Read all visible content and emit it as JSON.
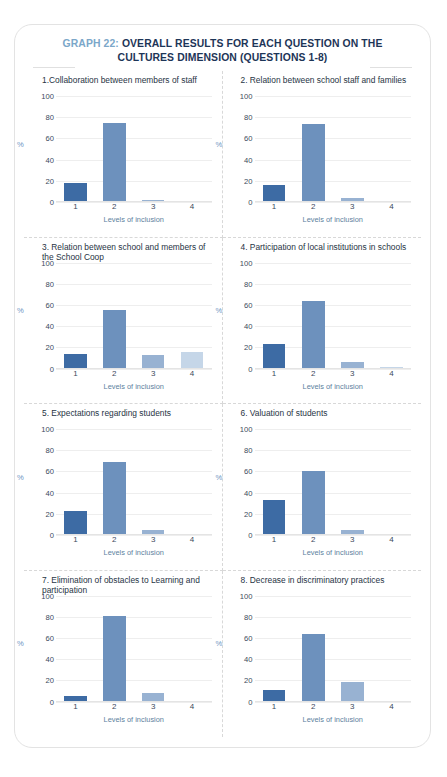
{
  "header": {
    "graph_number": "GRAPH 22:",
    "title_line1": " OVERALL RESULTS FOR EACH QUESTION ON THE",
    "title_line2": "CULTURES DIMENSION (QUESTIONS 1-8)",
    "number_color": "#7ba7c9",
    "title_color": "#1d3557"
  },
  "common": {
    "ylabel": "%",
    "xlabel": "Levels of inclusion",
    "yticks": [
      100,
      80,
      60,
      40,
      20,
      0
    ],
    "xticks": [
      "1",
      "2",
      "3",
      "4"
    ],
    "ylim": [
      0,
      100
    ],
    "bar_colors": [
      "#3d6ba4",
      "#6d91bd",
      "#98b2d2",
      "#c5d6e8"
    ]
  },
  "chart_data": [
    {
      "type": "bar",
      "panel": 1,
      "title": "1.Collaboration between members of staff",
      "categories": [
        "1",
        "2",
        "3",
        "4"
      ],
      "values": [
        18,
        75,
        1.5,
        0
      ],
      "xlabel": "Levels of inclusion",
      "ylabel": "%",
      "ylim": [
        0,
        100
      ],
      "grid": true
    },
    {
      "type": "bar",
      "panel": 2,
      "title": "2. Relation between school staff and families",
      "categories": [
        "1",
        "2",
        "3",
        "4"
      ],
      "values": [
        16,
        74,
        4,
        0
      ],
      "xlabel": "Levels of inclusion",
      "ylabel": "%",
      "ylim": [
        0,
        100
      ],
      "grid": true
    },
    {
      "type": "bar",
      "panel": 3,
      "title": "3. Relation between school and members of the School Coop",
      "categories": [
        "1",
        "2",
        "3",
        "4"
      ],
      "values": [
        14,
        55,
        13,
        16
      ],
      "xlabel": "Levels of inclusion",
      "ylabel": "%",
      "ylim": [
        0,
        100
      ],
      "grid": true
    },
    {
      "type": "bar",
      "panel": 4,
      "title": "4. Participation of local institutions in schools",
      "categories": [
        "1",
        "2",
        "3",
        "4"
      ],
      "values": [
        23,
        64,
        6,
        1
      ],
      "xlabel": "Levels of inclusion",
      "ylabel": "%",
      "ylim": [
        0,
        100
      ],
      "grid": true
    },
    {
      "type": "bar",
      "panel": 5,
      "title": "5. Expectations regarding students",
      "categories": [
        "1",
        "2",
        "3",
        "4"
      ],
      "values": [
        23,
        69,
        5,
        0
      ],
      "xlabel": "Levels of inclusion",
      "ylabel": "%",
      "ylim": [
        0,
        100
      ],
      "grid": true
    },
    {
      "type": "bar",
      "panel": 6,
      "title": "6. Valuation of students",
      "categories": [
        "1",
        "2",
        "3",
        "4"
      ],
      "values": [
        33,
        60,
        5,
        0
      ],
      "xlabel": "Levels of inclusion",
      "ylabel": "%",
      "ylim": [
        0,
        100
      ],
      "grid": true
    },
    {
      "type": "bar",
      "panel": 7,
      "title": "7. Elimination of obstacles to Learning and participation",
      "categories": [
        "1",
        "2",
        "3",
        "4"
      ],
      "values": [
        5,
        81,
        8,
        0
      ],
      "xlabel": "Levels of inclusion",
      "ylabel": "%",
      "ylim": [
        0,
        100
      ],
      "grid": true
    },
    {
      "type": "bar",
      "panel": 8,
      "title": "8. Decrease in discriminatory practices",
      "categories": [
        "1",
        "2",
        "3",
        "4"
      ],
      "values": [
        11,
        64,
        18,
        0
      ],
      "xlabel": "Levels of inclusion",
      "ylabel": "%",
      "ylim": [
        0,
        100
      ],
      "grid": true
    }
  ]
}
